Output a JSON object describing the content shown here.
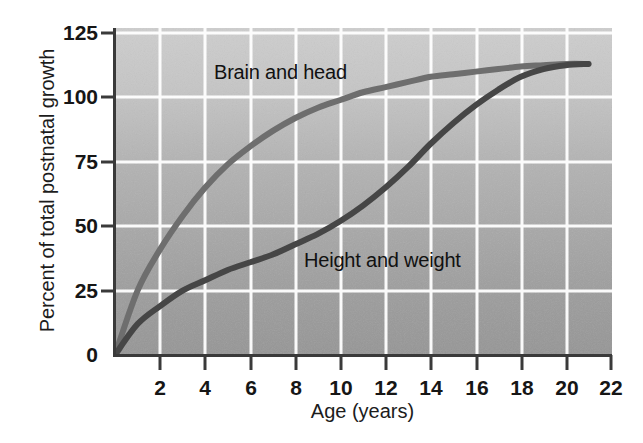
{
  "chart_data": {
    "type": "line",
    "title": "",
    "xlabel": "Age (years)",
    "ylabel": "Percent of total postnatal growth",
    "xlim": [
      0,
      22
    ],
    "ylim": [
      0,
      131
    ],
    "xticks": [
      "2",
      "4",
      "6",
      "8",
      "10",
      "12",
      "14",
      "16",
      "18",
      "20",
      "22"
    ],
    "yticks": [
      "0",
      "25",
      "50",
      "75",
      "100",
      "125"
    ],
    "grid": true,
    "legend_position": "inline-annotations",
    "x": [
      0,
      1,
      2,
      3,
      4,
      5,
      6,
      7,
      8,
      9,
      10,
      11,
      12,
      13,
      14,
      15,
      16,
      17,
      18,
      19,
      20,
      21
    ],
    "series": [
      {
        "name": "Brain and head",
        "color": "#6e6e6e",
        "values": [
          0,
          25,
          41,
          54,
          65,
          74,
          81,
          87,
          92,
          96,
          99,
          102,
          104,
          106,
          108,
          109,
          110,
          111,
          112,
          112.5,
          113,
          113
        ]
      },
      {
        "name": "Height and weight",
        "color": "#464646",
        "values": [
          0,
          12,
          19,
          25,
          29,
          33,
          36,
          39,
          43,
          47,
          52,
          58,
          65,
          73,
          82,
          90,
          97,
          103,
          108,
          111,
          112.5,
          113
        ]
      }
    ],
    "annotations": [
      {
        "text": "Brain and head",
        "x": 4.5,
        "y": 117
      },
      {
        "text": "Height and weight",
        "x": 8.5,
        "y": 45
      }
    ]
  },
  "axes": {
    "y_label": "Percent of total postnatal growth",
    "x_label": "Age (years)",
    "y_ticks": [
      {
        "label": "125"
      },
      {
        "label": "100"
      },
      {
        "label": "75"
      },
      {
        "label": "50"
      },
      {
        "label": "25"
      },
      {
        "label": "0"
      }
    ],
    "x_ticks": [
      {
        "label": "2"
      },
      {
        "label": "4"
      },
      {
        "label": "6"
      },
      {
        "label": "8"
      },
      {
        "label": "10"
      },
      {
        "label": "12"
      },
      {
        "label": "14"
      },
      {
        "label": "16"
      },
      {
        "label": "18"
      },
      {
        "label": "20"
      },
      {
        "label": "22"
      }
    ]
  },
  "series_labels": {
    "brain": "Brain and head",
    "height": "Height and weight"
  },
  "colors": {
    "brain_curve": "#6e6e6e",
    "height_curve": "#464646",
    "gridline": "#ffffff",
    "axis": "#3a3a3a",
    "plot_bg_top": "#cbcbcb",
    "plot_bg_bottom": "#9b9b9b",
    "page_bg": "#ffffff",
    "text": "#161616"
  }
}
